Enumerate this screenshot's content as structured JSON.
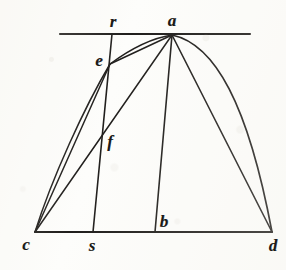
{
  "figure": {
    "stroke_color": "#201e1c",
    "background_color": "#fdfdfb"
  },
  "points": [
    {
      "id": "r",
      "label": "r",
      "x": 112,
      "y": 34,
      "label_x": 113,
      "label_y": 21
    },
    {
      "id": "a",
      "label": "a",
      "x": 172,
      "y": 35,
      "label_x": 172,
      "label_y": 20
    },
    {
      "id": "e",
      "label": "e",
      "x": 110,
      "y": 64,
      "label_x": 99,
      "label_y": 60
    },
    {
      "id": "f",
      "label": "f",
      "x": 103,
      "y": 134,
      "label_x": 110,
      "label_y": 141
    },
    {
      "id": "c",
      "label": "c",
      "x": 35,
      "y": 232,
      "label_x": 26,
      "label_y": 244
    },
    {
      "id": "s",
      "label": "s",
      "x": 93,
      "y": 232,
      "label_x": 92,
      "label_y": 245
    },
    {
      "id": "b",
      "label": "b",
      "x": 155,
      "y": 232,
      "label_x": 164,
      "label_y": 221
    },
    {
      "id": "d",
      "label": "d",
      "x": 272,
      "y": 232,
      "label_x": 273,
      "label_y": 245
    }
  ],
  "segments": [
    {
      "id": "tangent-line",
      "name": "tangent-line-through-a",
      "kind": "line",
      "x1": 60,
      "y1": 34,
      "x2": 250,
      "y2": 34,
      "width": 2.1
    },
    {
      "id": "baseline-cd",
      "name": "baseline-c-to-d",
      "kind": "line",
      "x1": 35,
      "y1": 232,
      "x2": 272,
      "y2": 232,
      "width": 2.2
    },
    {
      "id": "line-rs",
      "name": "oblique-line-r-to-s",
      "kind": "line",
      "x1": 112,
      "y1": 34,
      "x2": 93,
      "y2": 232,
      "width": 1.6
    },
    {
      "id": "chord-ce",
      "name": "chord-c-to-e",
      "kind": "line",
      "x1": 35,
      "y1": 232,
      "x2": 110,
      "y2": 64,
      "width": 1.5
    },
    {
      "id": "chord-ca",
      "name": "chord-c-to-a",
      "kind": "line",
      "x1": 35,
      "y1": 232,
      "x2": 172,
      "y2": 35,
      "width": 1.5
    },
    {
      "id": "chord-ea",
      "name": "chord-e-to-a",
      "kind": "line",
      "x1": 110,
      "y1": 64,
      "x2": 172,
      "y2": 35,
      "width": 1.5
    },
    {
      "id": "chord-ab",
      "name": "chord-a-to-b",
      "kind": "line",
      "x1": 172,
      "y1": 35,
      "x2": 155,
      "y2": 232,
      "width": 1.6
    },
    {
      "id": "chord-ad",
      "name": "chord-a-to-d",
      "kind": "line",
      "x1": 172,
      "y1": 35,
      "x2": 272,
      "y2": 232,
      "width": 1.6
    }
  ],
  "curves": [
    {
      "id": "arc-ce",
      "name": "arc-c-to-e",
      "kind": "curve",
      "d": "M 35 232 C 52 178 84 108 110 64",
      "width": 1.5
    },
    {
      "id": "arc-ea",
      "name": "arc-e-to-a",
      "kind": "curve",
      "d": "M 110 64 C 129 50 152 38 172 35",
      "width": 1.5
    },
    {
      "id": "arc-ad",
      "name": "arc-a-to-d",
      "kind": "curve",
      "d": "M 172 35 C 215 44 248 104 272 232",
      "width": 1.7
    }
  ]
}
